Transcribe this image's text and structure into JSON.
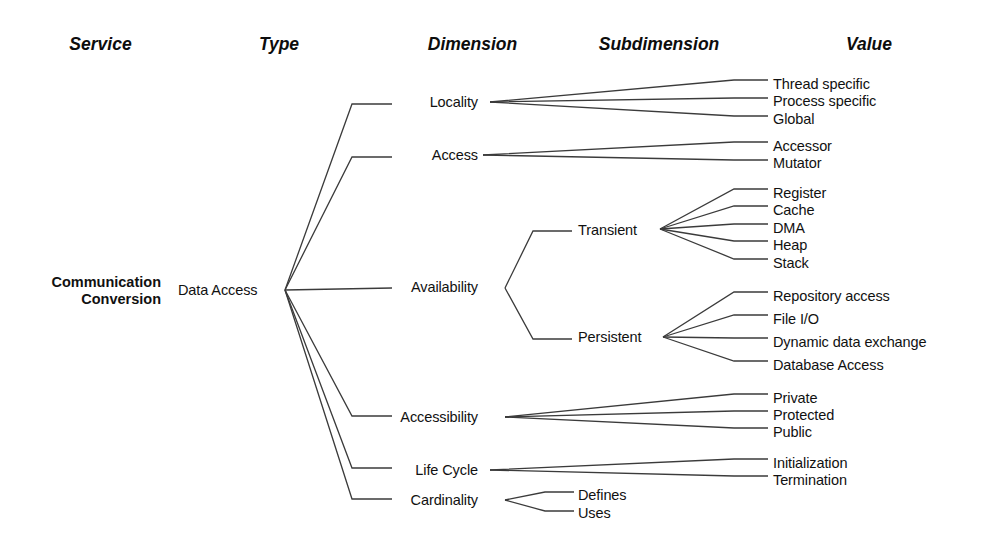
{
  "figure": {
    "frame": {
      "x": 33,
      "y": 27,
      "width": 942,
      "height": 506
    },
    "header_rule_y": 64,
    "band_color": "#e4e4e4",
    "line_color": "#3b3b3b",
    "text_color": "#111111"
  },
  "columns": [
    {
      "key": "service",
      "label": "Service",
      "x": 33,
      "width": 135,
      "shaded": false,
      "center": 100
    },
    {
      "key": "type",
      "label": "Type",
      "x": 168,
      "width": 222,
      "shaded": true,
      "center": 279
    },
    {
      "key": "dimension",
      "label": "Dimension",
      "x": 390,
      "width": 165,
      "shaded": false,
      "center": 472
    },
    {
      "key": "subdimension",
      "label": "Subdimension",
      "x": 555,
      "width": 208,
      "shaded": true,
      "center": 659
    },
    {
      "key": "value",
      "label": "Value",
      "x": 763,
      "width": 212,
      "shaded": false,
      "center": 869
    }
  ],
  "service": {
    "name_line1": "Communication",
    "name_line2": "Conversion",
    "y": 283
  },
  "type": {
    "label": "Data Access",
    "x": 178,
    "y": 290,
    "fan_origin": {
      "x": 285,
      "y": 290
    }
  },
  "dimensions": [
    {
      "label": "Locality",
      "y": 102,
      "x_right": 478
    },
    {
      "label": "Access",
      "y": 155,
      "x_right": 478
    },
    {
      "label": "Availability",
      "y": 287,
      "x_right": 478
    },
    {
      "label": "Accessibility",
      "y": 417,
      "x_right": 478
    },
    {
      "label": "Life Cycle",
      "y": 470,
      "x_right": 478
    },
    {
      "label": "Cardinality",
      "y": 500,
      "x_right": 478
    }
  ],
  "subdimensions": [
    {
      "label": "Transient",
      "y": 230,
      "x": 578,
      "parent": "Availability"
    },
    {
      "label": "Persistent",
      "y": 337,
      "x": 578,
      "parent": "Availability"
    },
    {
      "label": "Defines",
      "y": 495,
      "x": 578,
      "parent": "Cardinality"
    },
    {
      "label": "Uses",
      "y": 513,
      "x": 578,
      "parent": "Cardinality"
    }
  ],
  "values": [
    {
      "label": "Thread specific",
      "y": 84,
      "x": 773,
      "parent": "Locality"
    },
    {
      "label": "Process specific",
      "y": 101,
      "x": 773,
      "parent": "Locality"
    },
    {
      "label": "Global",
      "y": 119,
      "x": 773,
      "parent": "Locality"
    },
    {
      "label": "Accessor",
      "y": 146,
      "x": 773,
      "parent": "Access"
    },
    {
      "label": "Mutator",
      "y": 163,
      "x": 773,
      "parent": "Access"
    },
    {
      "label": "Register",
      "y": 193,
      "x": 773,
      "parent": "Transient"
    },
    {
      "label": "Cache",
      "y": 210,
      "x": 773,
      "parent": "Transient"
    },
    {
      "label": "DMA",
      "y": 228,
      "x": 773,
      "parent": "Transient"
    },
    {
      "label": "Heap",
      "y": 245,
      "x": 773,
      "parent": "Transient"
    },
    {
      "label": "Stack",
      "y": 263,
      "x": 773,
      "parent": "Transient"
    },
    {
      "label": "Repository access",
      "y": 296,
      "x": 773,
      "parent": "Persistent"
    },
    {
      "label": "File I/O",
      "y": 319,
      "x": 773,
      "parent": "Persistent"
    },
    {
      "label": "Dynamic data exchange",
      "y": 342,
      "x": 773,
      "parent": "Persistent"
    },
    {
      "label": "Database Access",
      "y": 365,
      "x": 773,
      "parent": "Persistent"
    },
    {
      "label": "Private",
      "y": 398,
      "x": 773,
      "parent": "Accessibility"
    },
    {
      "label": "Protected",
      "y": 415,
      "x": 773,
      "parent": "Accessibility"
    },
    {
      "label": "Public",
      "y": 432,
      "x": 773,
      "parent": "Accessibility"
    },
    {
      "label": "Initialization",
      "y": 463,
      "x": 773,
      "parent": "Life Cycle"
    },
    {
      "label": "Termination",
      "y": 480,
      "x": 773,
      "parent": "Life Cycle"
    }
  ],
  "connectors": {
    "type_to_dimension": [
      {
        "to": "Locality",
        "path": "M285,290 L352,104 L392,104"
      },
      {
        "to": "Access",
        "path": "M285,290 L352,157 L392,157"
      },
      {
        "to": "Availability",
        "path": "M285,290 L392,288"
      },
      {
        "to": "Accessibility",
        "path": "M285,290 L352,416 L392,416"
      },
      {
        "to": "Life Cycle",
        "path": "M285,290 L352,468 L392,468"
      },
      {
        "to": "Cardinality",
        "path": "M285,290 L352,499 L392,499"
      }
    ],
    "availability_bracket": [
      {
        "to": "Transient",
        "path": "M505,288 L533,231 L572,231"
      },
      {
        "to": "Persistent",
        "path": "M505,288 L533,339 L572,339"
      }
    ],
    "cardinality_bracket": [
      {
        "to": "Defines",
        "path": "M505,500 L545,492 L574,492"
      },
      {
        "to": "Uses",
        "path": "M505,500 L545,511 L574,511"
      }
    ],
    "locality_fan": {
      "origin": {
        "x": 490,
        "y": 102
      },
      "end_x": 768,
      "targets": [
        80,
        98,
        116
      ]
    },
    "access_fan": {
      "origin": {
        "x": 483,
        "y": 155
      },
      "end_x": 768,
      "targets": [
        142,
        160
      ]
    },
    "transient_fan": {
      "origin": {
        "x": 660,
        "y": 229
      },
      "end_x": 768,
      "targets": [
        189,
        206,
        224,
        241,
        259
      ]
    },
    "persistent_fan": {
      "origin": {
        "x": 663,
        "y": 337
      },
      "end_x": 768,
      "targets": [
        292,
        315,
        338,
        361
      ]
    },
    "accessibility_fan": {
      "origin": {
        "x": 505,
        "y": 417
      },
      "end_x": 768,
      "targets": [
        394,
        411,
        428
      ]
    },
    "lifecycle_fan": {
      "origin": {
        "x": 490,
        "y": 470
      },
      "end_x": 768,
      "targets": [
        459,
        476
      ]
    }
  }
}
